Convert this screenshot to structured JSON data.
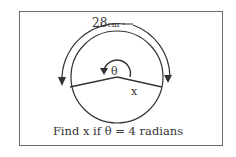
{
  "diagram": {
    "arc_length_label": "28",
    "arc_length_unit": "cm",
    "angle_label": "θ",
    "radius_label": "x",
    "caption": "Find x if θ = 4 radians"
  },
  "colors": {
    "stroke": "#333333",
    "border": "#6b6b6b",
    "background": "#ffffff"
  },
  "geometry": {
    "circle_center": [
      117,
      77
    ],
    "circle_radius": 46,
    "angle_radians": 4
  }
}
